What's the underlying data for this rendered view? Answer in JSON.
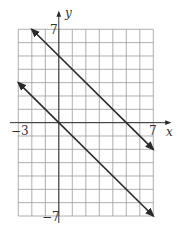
{
  "chart_data": {
    "type": "line",
    "title": "",
    "xlabel": "x",
    "ylabel": "y",
    "xlim": [
      -3,
      7
    ],
    "ylim": [
      -7,
      7
    ],
    "grid": true,
    "grid_step": 1,
    "tick_labels": {
      "x_min": "−3",
      "x_max": "7",
      "y_max": "7",
      "y_min": "−7"
    },
    "series": [
      {
        "name": "upper line",
        "equation": "y = -x + 5",
        "x": [
          -2,
          7
        ],
        "y": [
          7,
          -2
        ],
        "arrows": "both"
      },
      {
        "name": "lower line",
        "equation": "y = -x",
        "x": [
          -3,
          7
        ],
        "y": [
          3,
          -7
        ],
        "arrows": "both"
      }
    ],
    "colors": {
      "grid": "#9a9a9a",
      "axis": "#333333",
      "line": "#2a2a2a"
    }
  }
}
